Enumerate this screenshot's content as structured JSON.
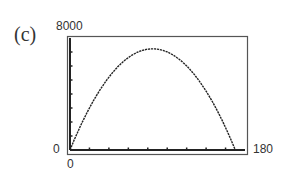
{
  "panel_label": "(c)",
  "window": {
    "xmin_label": "0",
    "xmax_label": "180",
    "ymin_label": "0",
    "ymax_label": "8000"
  },
  "chart_data": {
    "type": "line",
    "title": "",
    "xlabel": "",
    "ylabel": "",
    "xlim": [
      0,
      180
    ],
    "ylim": [
      0,
      8000
    ],
    "x_tick_interval": 20,
    "y_tick_interval": 1000,
    "grid": false,
    "legend": null,
    "series": [
      {
        "name": "y = x(170 - x)",
        "x": [
          0,
          10,
          20,
          30,
          40,
          50,
          60,
          70,
          80,
          85,
          90,
          100,
          110,
          120,
          130,
          140,
          150,
          160,
          170
        ],
        "y": [
          0,
          1600,
          3000,
          4200,
          5200,
          6000,
          6600,
          7000,
          7200,
          7225,
          7200,
          7000,
          6600,
          6000,
          5200,
          4200,
          3000,
          1600,
          0
        ]
      }
    ]
  }
}
